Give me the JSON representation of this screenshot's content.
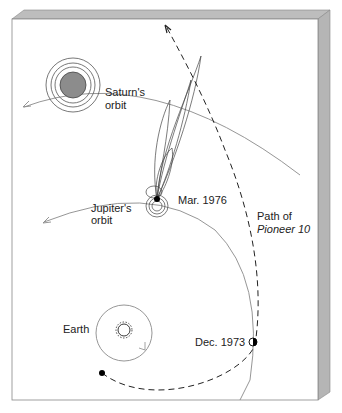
{
  "diagram": {
    "labels": {
      "saturn_orbit_line1": "Saturn's",
      "saturn_orbit_line2": "orbit",
      "jupiter_orbit_line1": "Jupiter's",
      "jupiter_orbit_line2": "orbit",
      "earth": "Earth",
      "mar_1976": "Mar. 1976",
      "dec_1973": "Dec. 1973",
      "path_line1": "Path of",
      "path_line2": "Pioneer 10"
    },
    "elements": [
      {
        "name": "Sun",
        "icon": "sun-icon"
      },
      {
        "name": "Earth",
        "icon": "planet-dot"
      },
      {
        "name": "Jupiter",
        "icon": "planet-dot",
        "note": "magnetosphere field lines"
      },
      {
        "name": "Saturn",
        "icon": "ringed-planet",
        "color": "#8c8c8c"
      },
      {
        "name": "Pioneer 10 trajectory",
        "style": "dashed"
      }
    ],
    "colors": {
      "board": "#ffffff",
      "bevel": "#b8b8b8",
      "orbit": "#8a8a8a",
      "lines": "#333333",
      "saturn": "#8c8c8c"
    }
  }
}
